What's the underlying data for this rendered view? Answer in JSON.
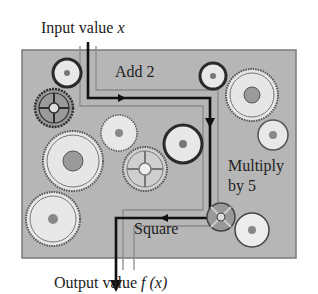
{
  "input_label": {
    "text": "Input value ",
    "var": "x"
  },
  "output_label": {
    "text": "Output value ",
    "var": "f (x)"
  },
  "steps": [
    {
      "label": "Add 2"
    },
    {
      "label": "Multiply"
    },
    {
      "label": "by 5"
    },
    {
      "label": "Square"
    }
  ],
  "colors": {
    "panel": "#b4b4b4",
    "panel_border": "#777777",
    "gear_fill": "#e6e6e6",
    "gear_dark": "#3a3a3a",
    "path": "#111111",
    "pipe": "#8a8a8a"
  }
}
